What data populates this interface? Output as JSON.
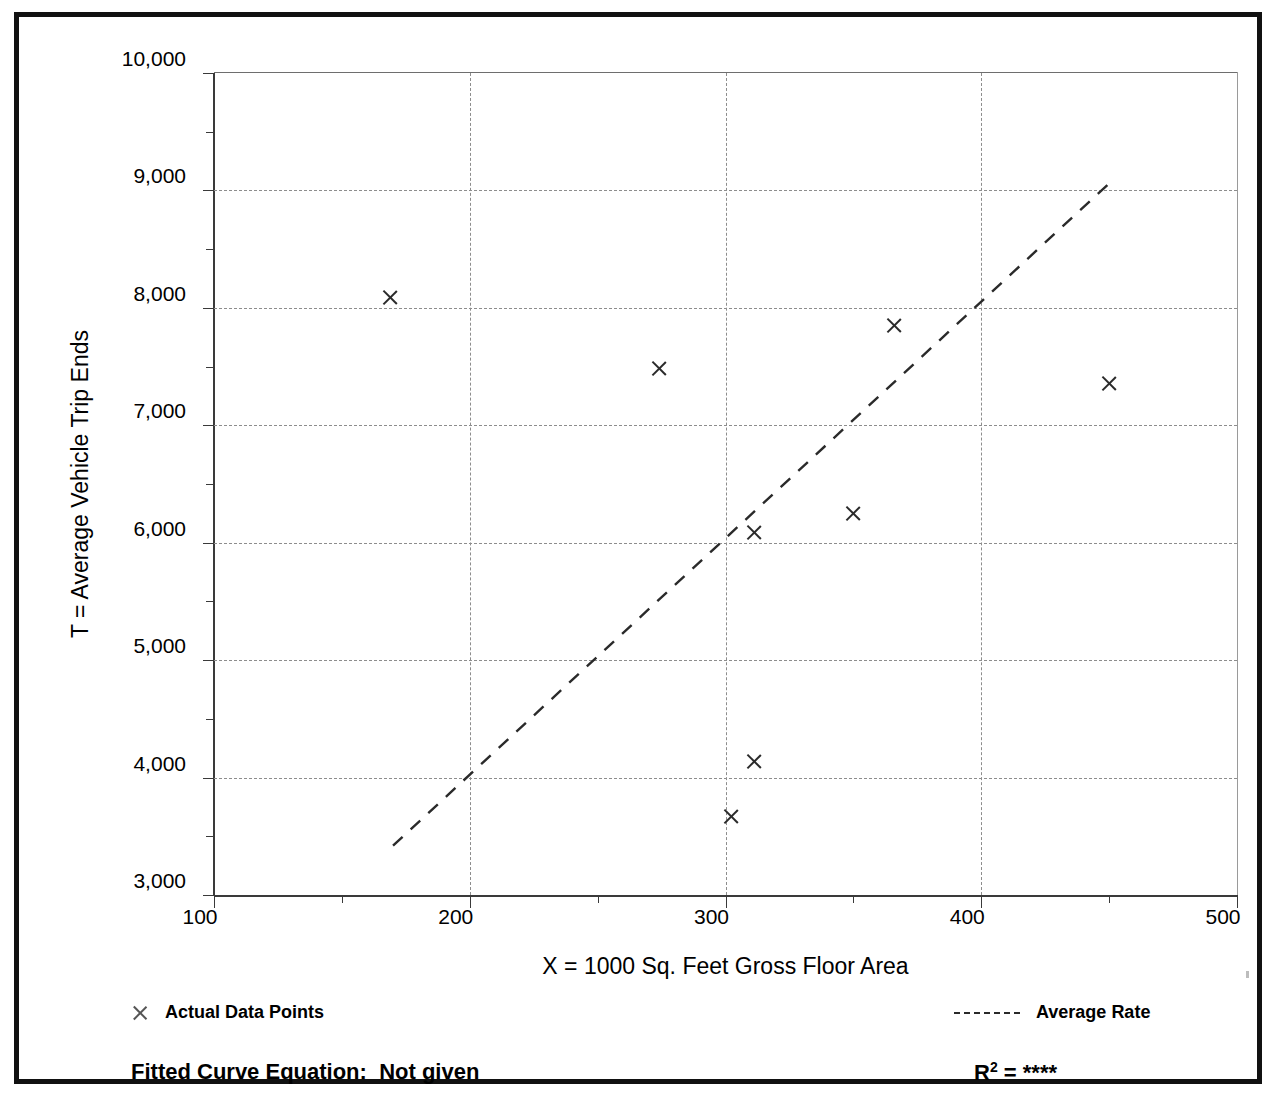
{
  "figure": {
    "cut_off_title_fragment": "",
    "y_axis_title": "T = Average Vehicle Trip Ends",
    "x_axis_title": "X = 1000 Sq. Feet Gross Floor Area",
    "legend": {
      "data_points_label": "Actual Data Points",
      "data_points_marker": "x-marker-icon",
      "average_rate_label": "Average Rate",
      "average_rate_marker": "dashed-line-icon"
    },
    "footer": {
      "fitted_curve_label": "Fitted Curve Equation:",
      "fitted_curve_value": "Not given",
      "rsq_label": "R",
      "rsq_exponent": "2",
      "rsq_equals": "=",
      "rsq_value": "****"
    },
    "colors": {
      "ink": "#111111",
      "grid": "#8d8d8d",
      "marker": "#2a2a2a",
      "axis": "#3a3a3a",
      "background": "#ffffff"
    }
  },
  "chart_data": {
    "type": "scatter",
    "title": "",
    "xlabel": "X = 1000 Sq. Feet Gross Floor Area",
    "ylabel": "T = Average Vehicle Trip Ends",
    "xlim": [
      100,
      500
    ],
    "ylim": [
      3000,
      10000
    ],
    "x_major_ticks": [
      100,
      200,
      300,
      400,
      500
    ],
    "x_minor_ticks": [
      150,
      250,
      350,
      450
    ],
    "x_tick_labels": [
      "100",
      "200",
      "300",
      "400",
      "500"
    ],
    "y_major_ticks": [
      3000,
      4000,
      5000,
      6000,
      7000,
      8000,
      9000,
      10000
    ],
    "y_minor_ticks": [
      3500,
      4500,
      5500,
      6500,
      7500,
      8500,
      9500
    ],
    "y_tick_labels": [
      "3,000",
      "4,000",
      "5,000",
      "6,000",
      "7,000",
      "8,000",
      "9,000",
      "10,000"
    ],
    "grid": true,
    "grid_style": "dashed",
    "legend_position": "below-axes",
    "series": [
      {
        "name": "Actual Data Points",
        "type": "scatter",
        "marker": "x",
        "points": [
          {
            "x": 169,
            "y": 8090
          },
          {
            "x": 274,
            "y": 7480
          },
          {
            "x": 302,
            "y": 3670
          },
          {
            "x": 311,
            "y": 4140
          },
          {
            "x": 311,
            "y": 6090
          },
          {
            "x": 350,
            "y": 6250
          },
          {
            "x": 366,
            "y": 7850
          },
          {
            "x": 450,
            "y": 7360
          }
        ]
      },
      {
        "name": "Average Rate",
        "type": "line",
        "style": "dashed",
        "x": [
          170,
          450
        ],
        "y": [
          3420,
          9060
        ]
      }
    ],
    "annotations": [
      {
        "text": "Fitted Curve Equation:  Not given"
      },
      {
        "text": "R2 = ****"
      }
    ]
  }
}
